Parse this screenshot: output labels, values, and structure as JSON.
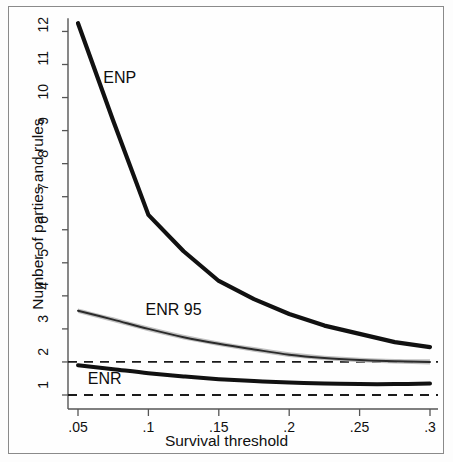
{
  "figure": {
    "background_color": "#fdfdfd",
    "frame_color": "#8a8a8a"
  },
  "chart_data": {
    "type": "line",
    "title": "",
    "xlabel": "Survival threshold",
    "ylabel": "Number of parties and rules",
    "xlim": [
      0.05,
      0.3
    ],
    "ylim": [
      1,
      12.4
    ],
    "grid": false,
    "legend_position": "inline-annotations",
    "xticks": [
      0.05,
      0.1,
      0.15,
      0.2,
      0.25,
      0.3
    ],
    "xticklabels": [
      ".05",
      ".1",
      ".15",
      ".2",
      ".25",
      ".3"
    ],
    "yticks": [
      1,
      2,
      3,
      4,
      5,
      6,
      7,
      8,
      9,
      10,
      11,
      12
    ],
    "yticklabels": [
      "1",
      "2",
      "3",
      "4",
      "5",
      "6",
      "7",
      "8",
      "9",
      "10",
      "11",
      "12"
    ],
    "x": [
      0.05,
      0.075,
      0.1,
      0.125,
      0.15,
      0.175,
      0.2,
      0.225,
      0.25,
      0.275,
      0.3
    ],
    "series": [
      {
        "name": "ENP",
        "label": "ENP",
        "color": "#111111",
        "linewidth": 4.2,
        "style": "solid",
        "values": [
          12.25,
          9.3,
          6.45,
          5.35,
          4.45,
          3.9,
          3.45,
          3.1,
          2.85,
          2.6,
          2.45
        ]
      },
      {
        "name": "ENR 95",
        "label": "ENR 95",
        "color": "#2b2b2b",
        "band_color": "#b5b5b5",
        "linewidth": 2.0,
        "style": "solid-with-confidence-band",
        "values": [
          3.55,
          3.28,
          3.0,
          2.75,
          2.55,
          2.38,
          2.22,
          2.12,
          2.06,
          2.02,
          2.0
        ],
        "band_upper": [
          3.62,
          3.35,
          3.07,
          2.82,
          2.62,
          2.45,
          2.29,
          2.19,
          2.13,
          2.09,
          2.08
        ],
        "band_lower": [
          3.48,
          3.21,
          2.93,
          2.68,
          2.48,
          2.31,
          2.15,
          2.05,
          1.99,
          1.95,
          1.92
        ]
      },
      {
        "name": "ENR",
        "label": "ENR",
        "color": "#111111",
        "linewidth": 4.0,
        "style": "solid",
        "values": [
          1.9,
          1.78,
          1.66,
          1.56,
          1.48,
          1.42,
          1.38,
          1.35,
          1.33,
          1.33,
          1.35
        ]
      }
    ],
    "reference_lines": [
      {
        "name": "two-party-reference",
        "y": 2,
        "style": "dashed",
        "color": "#1a1a1a"
      },
      {
        "name": "one-party-reference",
        "y": 1,
        "style": "dashed",
        "color": "#1a1a1a"
      }
    ],
    "annotations": [
      {
        "name": "enp-annotation",
        "text": "ENP",
        "x": 0.068,
        "y": 10.55
      },
      {
        "name": "enr95-annotation",
        "text": "ENR 95",
        "x": 0.098,
        "y": 3.55
      },
      {
        "name": "enr-annotation",
        "text": "ENR",
        "x": 0.057,
        "y": 1.45
      }
    ]
  }
}
